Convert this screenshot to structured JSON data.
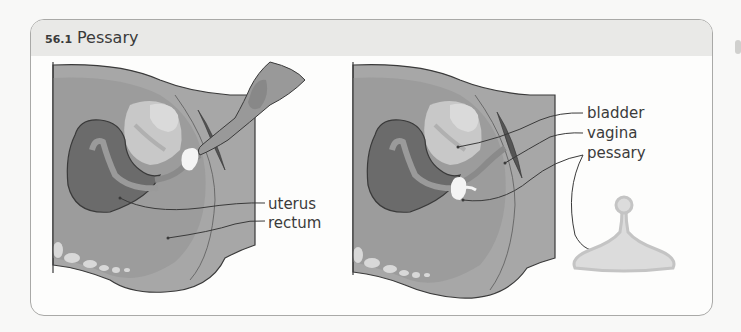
{
  "figure": {
    "number": "56.1",
    "title": "Pessary"
  },
  "left_diagram": {
    "description": "Sagittal pelvic cross-section showing pessary being inserted by hand",
    "labels": [
      {
        "text": "uterus",
        "x": 268,
        "y": 204
      },
      {
        "text": "rectum",
        "x": 268,
        "y": 224
      }
    ]
  },
  "right_diagram": {
    "description": "Sagittal pelvic cross-section with pessary in place",
    "labels": [
      {
        "text": "bladder",
        "x": 587,
        "y": 112
      },
      {
        "text": "vagina",
        "x": 587,
        "y": 132
      },
      {
        "text": "pessary",
        "x": 587,
        "y": 153
      }
    ]
  },
  "pessary_device": {
    "description": "Standalone pessary device (bell shape with knob)"
  },
  "colors": {
    "tissue_dark": "#6b6b6b",
    "tissue_mid": "#9a9a9a",
    "tissue_light": "#b4b4b4",
    "bladder_light": "#d2d2d2",
    "background_body": "#a7a7a7",
    "pessary_fill": "#dcdcdc",
    "line": "#3a3a3a"
  }
}
